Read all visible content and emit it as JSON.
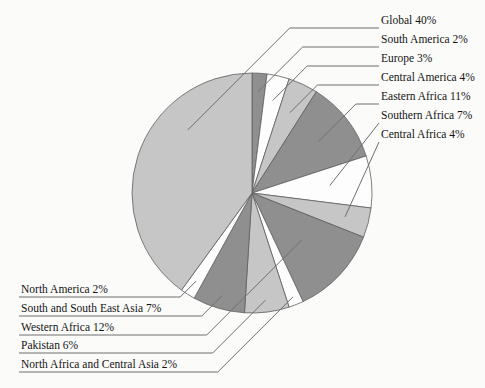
{
  "figure": {
    "background": "#fbfbfa",
    "callouts": {
      "right": [
        {
          "slice": "Global",
          "text": "Global 40%"
        },
        {
          "slice": "South America",
          "text": "South America 2%"
        },
        {
          "slice": "Europe",
          "text": "Europe 3%"
        },
        {
          "slice": "Central America",
          "text": "Central America 4%"
        },
        {
          "slice": "Eastern Africa",
          "text": "Eastern Africa 11%"
        },
        {
          "slice": "Southern Africa",
          "text": "Southern Africa 7%"
        },
        {
          "slice": "Central Africa",
          "text": "Central Africa 4%"
        }
      ],
      "left": [
        {
          "slice": "North America",
          "text": "North America 2%"
        },
        {
          "slice": "South and South East Asia",
          "text": "South and South East Asia 7%"
        },
        {
          "slice": "Western Africa",
          "text": "Western Africa 12%"
        },
        {
          "slice": "Pakistan",
          "text": "Pakistan 6%"
        },
        {
          "slice": "North Africa and Central Asia",
          "text": "North Africa and Central Asia 2%"
        }
      ]
    }
  },
  "chart_data": {
    "type": "pie",
    "title": "",
    "unit": "%",
    "start_angle_deg": 0,
    "direction": "clockwise",
    "slices": [
      {
        "label": "South America",
        "value": 2,
        "shade": "dark"
      },
      {
        "label": "Europe",
        "value": 3,
        "shade": "white"
      },
      {
        "label": "Central America",
        "value": 4,
        "shade": "light"
      },
      {
        "label": "Eastern Africa",
        "value": 11,
        "shade": "dark"
      },
      {
        "label": "Southern Africa",
        "value": 7,
        "shade": "white"
      },
      {
        "label": "Central Africa",
        "value": 4,
        "shade": "light"
      },
      {
        "label": "Western Africa",
        "value": 12,
        "shade": "dark"
      },
      {
        "label": "North Africa and Central Asia",
        "value": 2,
        "shade": "white"
      },
      {
        "label": "Pakistan",
        "value": 6,
        "shade": "light"
      },
      {
        "label": "South and South East Asia",
        "value": 7,
        "shade": "dark"
      },
      {
        "label": "North America",
        "value": 2,
        "shade": "white"
      },
      {
        "label": "Global",
        "value": 40,
        "shade": "light"
      }
    ],
    "palette": {
      "dark": "#8f8f8f",
      "white": "#fdfdfd",
      "light": "#c6c6c6"
    },
    "outline_color": "#5f5f5f",
    "leader_line_color": "#6f6f6f",
    "label_color": "#141414",
    "legend_position": "callout-labels",
    "labels_show": "name-and-percent"
  }
}
